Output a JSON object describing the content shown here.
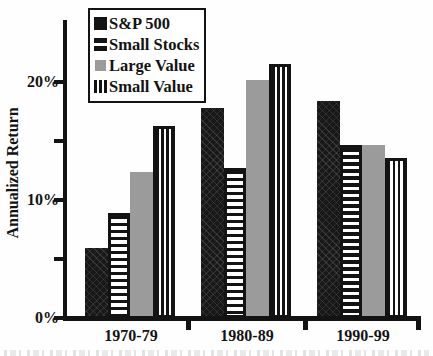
{
  "chart_data": {
    "type": "bar",
    "title": "",
    "ylabel": "Annualized Return",
    "xlabel": "",
    "categories": [
      "1970-79",
      "1980-89",
      "1990-99"
    ],
    "series": [
      {
        "name": "S&P 500",
        "pattern": "solid-black",
        "values": [
          5.9,
          17.8,
          18.4
        ]
      },
      {
        "name": "Small Stocks",
        "pattern": "horizontal-stripes",
        "values": [
          8.9,
          12.7,
          14.7
        ]
      },
      {
        "name": "Large Value",
        "pattern": "solid-gray",
        "values": [
          12.4,
          20.2,
          14.7
        ]
      },
      {
        "name": "Small Value",
        "pattern": "vertical-stripes",
        "values": [
          16.3,
          21.5,
          13.6
        ]
      }
    ],
    "ylim": [
      0,
      25
    ],
    "yticks": [
      {
        "value": 0,
        "label": "0%"
      },
      {
        "value": 5,
        "label": ""
      },
      {
        "value": 10,
        "label": "10%"
      },
      {
        "value": 15,
        "label": ""
      },
      {
        "value": 20,
        "label": "20%"
      }
    ],
    "grid": false,
    "legend_position": "top-left",
    "colors": {
      "bar_black": "#131313",
      "bar_gray": "#9b9b9b",
      "stripe_white": "#ffffff",
      "background": "#fefefe"
    }
  }
}
